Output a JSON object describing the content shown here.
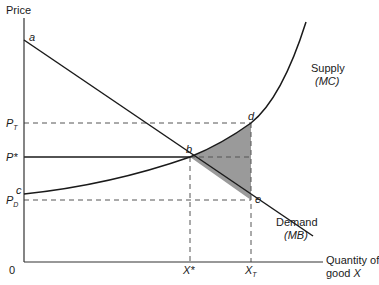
{
  "diagram": {
    "axes": {
      "y_label": "Price",
      "x_label_line1": "Quantity of",
      "x_label_line2_prefix": "good ",
      "x_label_line2_var": "X",
      "origin": "0"
    },
    "price_labels": {
      "p_t_main": "P",
      "p_t_sub": "T",
      "p_star": "P*",
      "p_d_main": "P",
      "p_d_sub": "D"
    },
    "quantity_labels": {
      "x_star": "X*",
      "x_t_main": "X",
      "x_t_sub": "T"
    },
    "points": {
      "a": "a",
      "b": "b",
      "c": "c",
      "d": "d",
      "e": "e"
    },
    "curves": {
      "supply_label": "Supply",
      "supply_sub": "(MC)",
      "demand_label": "Demand",
      "demand_sub": "(MB)"
    },
    "colors": {
      "line": "#1a1a1a",
      "dashed": "#555555",
      "shaded_area": "#9a9a9a"
    }
  }
}
